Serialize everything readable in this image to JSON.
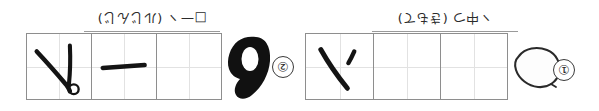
{
  "page": {
    "orientation": "upside-down (rotated 180 degrees)",
    "background_color": "#ffffff",
    "ink_color": "#1a1a1a",
    "grid_border_color": "#8e8e8e",
    "guide_line_color": "#e2e2e2"
  },
  "rows": [
    {
      "id": "row-1",
      "marker": {
        "label": "②",
        "number": 2
      },
      "header": {
        "kana_reading": "(ルじんじ)",
        "main_text": "□一ヽ",
        "full_text": "□一ヽ (ルじんじ)"
      },
      "grid": {
        "cell_count": 3,
        "cells": [
          {
            "index": 1,
            "stroke": "hand-written-stroke-v-with-small-circle",
            "filled": true
          },
          {
            "index": 2,
            "stroke": "hand-written-stroke-horizontal-bar",
            "filled": true
          },
          {
            "index": 3,
            "stroke": "",
            "filled": false
          }
        ]
      },
      "blob": {
        "shape": "filled-ink-loop-blob",
        "style": "solid-black"
      }
    },
    {
      "id": "row-2",
      "marker": {
        "label": "①",
        "number": 1
      },
      "header": {
        "kana_reading": "(きもて)",
        "main_text": "ヽ中つ",
        "full_text": "ヽ中つ (きもて)"
      },
      "grid": {
        "cell_count": 3,
        "cells": [
          {
            "index": 1,
            "stroke": "hand-written-stroke-diagonal-with-tick",
            "filled": true
          },
          {
            "index": 2,
            "stroke": "",
            "filled": false
          },
          {
            "index": 3,
            "stroke": "",
            "filled": false
          }
        ]
      },
      "blob": {
        "shape": "outlined-leaf-blob",
        "style": "outline-only"
      }
    }
  ]
}
